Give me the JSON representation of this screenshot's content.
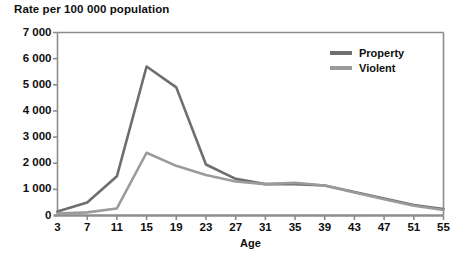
{
  "chart_data": {
    "type": "line",
    "title": "Rate per 100 000 population",
    "xlabel": "Age",
    "ylabel": "",
    "xlim": [
      3,
      55
    ],
    "ylim": [
      0,
      7000
    ],
    "grid": false,
    "legend_position": "top-right",
    "x": [
      3,
      7,
      11,
      15,
      19,
      23,
      27,
      31,
      35,
      39,
      43,
      47,
      51,
      55
    ],
    "xticks": [
      "3",
      "7",
      "11",
      "15",
      "19",
      "23",
      "27",
      "31",
      "35",
      "39",
      "43",
      "47",
      "51",
      "55"
    ],
    "yticks": [
      "0",
      "1 000",
      "2 000",
      "3 000",
      "4 000",
      "5 000",
      "6 000",
      "7 000"
    ],
    "ytick_values": [
      0,
      1000,
      2000,
      3000,
      4000,
      5000,
      6000,
      7000
    ],
    "series": [
      {
        "name": "Property",
        "color": "#6e6e6e",
        "values": [
          150,
          500,
          1500,
          5700,
          4900,
          1950,
          1400,
          1200,
          1200,
          1150,
          900,
          650,
          400,
          250
        ]
      },
      {
        "name": "Violent",
        "color": "#9b9b9b",
        "values": [
          70,
          120,
          270,
          2400,
          1900,
          1550,
          1300,
          1200,
          1250,
          1150,
          880,
          620,
          370,
          210
        ]
      }
    ]
  },
  "legend": {
    "items": [
      {
        "label": "Property",
        "color": "#6e6e6e"
      },
      {
        "label": "Violent",
        "color": "#9b9b9b"
      }
    ]
  },
  "axis_style": {
    "axis_color": "#8c8c8c",
    "text_color": "#0f0f0f"
  }
}
